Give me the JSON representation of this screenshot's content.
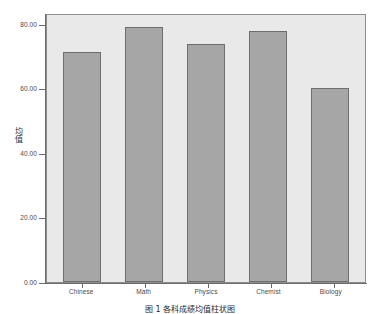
{
  "chart_data": {
    "type": "bar",
    "title": "",
    "categories": [
      "Chinese",
      "Math",
      "Physics",
      "Chemist",
      "Biology"
    ],
    "values": [
      71.2,
      79.2,
      73.8,
      77.7,
      60.3
    ],
    "series": [
      {
        "name": "均值",
        "values": [
          71.2,
          79.2,
          73.8,
          77.7,
          60.3
        ]
      }
    ],
    "xlabel": "",
    "ylabel": "均值",
    "ylim": [
      0,
      80
    ],
    "y_ticks": [
      0,
      20,
      40,
      60,
      80
    ],
    "y_tick_labels": [
      "0.00",
      "20.00",
      "40.00",
      "60.00",
      "80.00"
    ],
    "grid": false,
    "legend": false,
    "bar_fill_color": "#a6a6a6",
    "bar_border_color": "#6e6e6e",
    "plot_background_color": "#e9e9e9",
    "axis_color": "#6b6b6b"
  },
  "axes": {
    "y_title_chars": [
      "均",
      "值"
    ],
    "y_tick_labels": [
      "80.00",
      "60.00",
      "40.00",
      "20.00",
      "0.00"
    ],
    "x_tick_labels": [
      "Chinese",
      "Math",
      "Physics",
      "Chemist",
      "Biology"
    ]
  },
  "caption": {
    "text": "图 1   各科成绩均值柱状图"
  }
}
